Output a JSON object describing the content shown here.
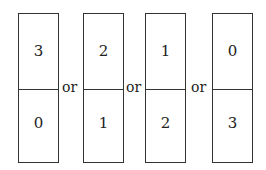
{
  "dominoes": [
    {
      "top": "3",
      "bottom": "0"
    },
    {
      "top": "2",
      "bottom": "1"
    },
    {
      "top": "1",
      "bottom": "2"
    },
    {
      "top": "0",
      "bottom": "3"
    }
  ],
  "separators": [
    "or",
    "or",
    "or"
  ]
}
